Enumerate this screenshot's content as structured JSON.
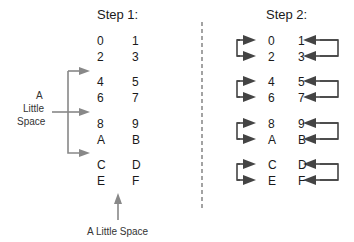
{
  "step1": {
    "title": "Step 1:",
    "rows": [
      [
        "0",
        "1"
      ],
      [
        "2",
        "3"
      ],
      [
        "4",
        "5"
      ],
      [
        "6",
        "7"
      ],
      [
        "8",
        "9"
      ],
      [
        "A",
        "B"
      ],
      [
        "C",
        "D"
      ],
      [
        "E",
        "F"
      ]
    ]
  },
  "step2": {
    "title": "Step 2:",
    "rows": [
      [
        "0",
        "1"
      ],
      [
        "2",
        "3"
      ],
      [
        "4",
        "5"
      ],
      [
        "6",
        "7"
      ],
      [
        "8",
        "9"
      ],
      [
        "A",
        "B"
      ],
      [
        "C",
        "D"
      ],
      [
        "E",
        "F"
      ]
    ]
  },
  "labels": {
    "side_a": "A",
    "side_little": "Little",
    "side_space": "Space",
    "bottom": "A Little Space"
  },
  "colors": {
    "arrow_gray": "#888888",
    "arrow_dark": "#444444",
    "text": "#1a1a1a"
  }
}
